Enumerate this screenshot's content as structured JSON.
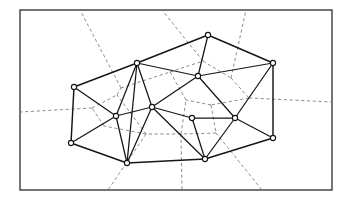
{
  "figure": {
    "caption": "",
    "frame": {
      "x": 20,
      "y": 10,
      "width": 312,
      "height": 180
    },
    "canvas": {
      "width": 349,
      "height": 200
    },
    "colors": {
      "background": "#ffffff",
      "frame": "#3a3a3a",
      "delaunay": "#161616",
      "voronoi": "#777777",
      "site_fill": "#ffffff",
      "site_stroke": "#111111"
    },
    "style": {
      "delaunay_stroke": "solid",
      "voronoi_stroke": "dashed",
      "site_radius": 2.6
    }
  },
  "chart_data": {
    "type": "scatter",
    "xlabel": "",
    "ylabel": "",
    "xlim": [
      20,
      332
    ],
    "ylim": [
      10,
      190
    ],
    "grid": false,
    "legend": null,
    "sites": [
      {
        "id": "S1",
        "label": "left",
        "x": 74,
        "y": 87
      },
      {
        "id": "S2",
        "label": "upper-left-hub",
        "x": 137,
        "y": 63
      },
      {
        "id": "S3",
        "label": "top-apex",
        "x": 208,
        "y": 35
      },
      {
        "id": "S4",
        "label": "upper-middle",
        "x": 198,
        "y": 76
      },
      {
        "id": "S5",
        "label": "right-top",
        "x": 273,
        "y": 63
      },
      {
        "id": "S6",
        "label": "right-middle",
        "x": 235,
        "y": 118
      },
      {
        "id": "S7",
        "label": "right-bottom",
        "x": 273,
        "y": 138
      },
      {
        "id": "S8",
        "label": "center-hub",
        "x": 152,
        "y": 107
      },
      {
        "id": "S9",
        "label": "left-middle",
        "x": 116,
        "y": 116
      },
      {
        "id": "S10",
        "label": "bottom-left",
        "x": 71,
        "y": 143
      },
      {
        "id": "S11",
        "label": "bottom-center",
        "x": 127,
        "y": 163
      },
      {
        "id": "S12",
        "label": "bottom-right",
        "x": 205,
        "y": 159
      },
      {
        "id": "S13",
        "label": "mid-lower",
        "x": 192,
        "y": 118
      }
    ],
    "hull_edges": [
      [
        "S1",
        "S2"
      ],
      [
        "S2",
        "S3"
      ],
      [
        "S3",
        "S5"
      ],
      [
        "S5",
        "S7"
      ],
      [
        "S7",
        "S12"
      ],
      [
        "S12",
        "S11"
      ],
      [
        "S11",
        "S10"
      ],
      [
        "S10",
        "S1"
      ]
    ],
    "delaunay_edges": [
      [
        "S1",
        "S2"
      ],
      [
        "S2",
        "S3"
      ],
      [
        "S3",
        "S5"
      ],
      [
        "S5",
        "S7"
      ],
      [
        "S7",
        "S12"
      ],
      [
        "S12",
        "S11"
      ],
      [
        "S11",
        "S10"
      ],
      [
        "S10",
        "S1"
      ],
      [
        "S2",
        "S4"
      ],
      [
        "S3",
        "S4"
      ],
      [
        "S4",
        "S5"
      ],
      [
        "S4",
        "S8"
      ],
      [
        "S4",
        "S6"
      ],
      [
        "S5",
        "S6"
      ],
      [
        "S6",
        "S7"
      ],
      [
        "S6",
        "S13"
      ],
      [
        "S6",
        "S12"
      ],
      [
        "S13",
        "S12"
      ],
      [
        "S13",
        "S8"
      ],
      [
        "S8",
        "S12"
      ],
      [
        "S2",
        "S8"
      ],
      [
        "S2",
        "S9"
      ],
      [
        "S1",
        "S9"
      ],
      [
        "S8",
        "S9"
      ],
      [
        "S9",
        "S10"
      ],
      [
        "S9",
        "S11"
      ],
      [
        "S8",
        "S11"
      ],
      [
        "S2",
        "S11"
      ]
    ],
    "voronoi_vertices": [
      {
        "id": "V1",
        "x": 121,
        "y": 88
      },
      {
        "id": "V2",
        "x": 170,
        "y": 72
      },
      {
        "id": "V3",
        "x": 203,
        "y": 61
      },
      {
        "id": "V4",
        "x": 231,
        "y": 78
      },
      {
        "id": "V5",
        "x": 249,
        "y": 98
      },
      {
        "id": "V6",
        "x": 211,
        "y": 105
      },
      {
        "id": "V7",
        "x": 186,
        "y": 100
      },
      {
        "id": "V8",
        "x": 216,
        "y": 133
      },
      {
        "id": "V9",
        "x": 181,
        "y": 134
      },
      {
        "id": "V10",
        "x": 146,
        "y": 134
      },
      {
        "id": "V11",
        "x": 104,
        "y": 126
      },
      {
        "id": "V12",
        "x": 92,
        "y": 108
      },
      {
        "id": "V13",
        "x": 117,
        "y": 95
      }
    ],
    "voronoi_edges": [
      [
        "V1",
        "V2"
      ],
      [
        "V2",
        "V3"
      ],
      [
        "V3",
        "V4"
      ],
      [
        "V4",
        "V5"
      ],
      [
        "V5",
        "V6"
      ],
      [
        "V6",
        "V7"
      ],
      [
        "V7",
        "V2"
      ],
      [
        "V6",
        "V8"
      ],
      [
        "V8",
        "V9"
      ],
      [
        "V9",
        "V7"
      ],
      [
        "V9",
        "V10"
      ],
      [
        "V10",
        "V11"
      ],
      [
        "V11",
        "V12"
      ],
      [
        "V12",
        "V13"
      ],
      [
        "V13",
        "V1"
      ],
      [
        "V10",
        "V13"
      ]
    ],
    "voronoi_rays": [
      {
        "from": "V1",
        "to_x": 80,
        "to_y": 10
      },
      {
        "from": "V3",
        "to_x": 162,
        "to_y": 10
      },
      {
        "from": "V4",
        "to_x": 246,
        "to_y": 10
      },
      {
        "from": "V5",
        "to_x": 332,
        "to_y": 102
      },
      {
        "from": "V8",
        "to_x": 262,
        "to_y": 190
      },
      {
        "from": "V9",
        "to_x": 182,
        "to_y": 190
      },
      {
        "from": "V10",
        "to_x": 108,
        "to_y": 190
      },
      {
        "from": "V12",
        "to_x": 20,
        "to_y": 112
      }
    ]
  }
}
